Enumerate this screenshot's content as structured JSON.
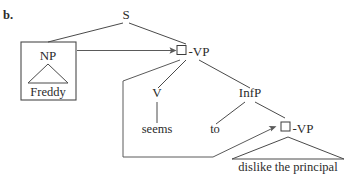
{
  "figure": {
    "item_label": "b.",
    "type": "syntax-tree",
    "background_color": "#ffffff",
    "line_color": "#4a4a4a",
    "text_color": "#2b2b2b"
  },
  "nodes": {
    "s": {
      "label": "S",
      "x": 126,
      "y": 19
    },
    "np": {
      "label": "NP",
      "x": 48,
      "y": 56
    },
    "np_terminal": {
      "label": "Freddy",
      "x": 48,
      "y": 96
    },
    "vp_top": {
      "label": "-VP",
      "x": 192,
      "y": 56
    },
    "v": {
      "label": "V",
      "x": 157,
      "y": 97
    },
    "v_terminal": {
      "label": "seems",
      "x": 157,
      "y": 133
    },
    "infp": {
      "label": "InfP",
      "x": 250,
      "y": 97
    },
    "inf_to": {
      "label": "to",
      "x": 215,
      "y": 133
    },
    "vp_low": {
      "label": "-VP",
      "x": 296,
      "y": 133
    },
    "vp_low_terminal": {
      "label": "dislike the principal",
      "x": 288,
      "y": 170
    }
  },
  "gap_squares": [
    {
      "name": "trace-square-upper",
      "x": 177,
      "y": 45,
      "size": 9
    },
    {
      "name": "trace-square-lower",
      "x": 281,
      "y": 122,
      "size": 9
    }
  ],
  "boxes": [
    {
      "name": "np-box",
      "x": 21,
      "y": 42,
      "width": 55,
      "height": 58
    }
  ],
  "triangles": [
    {
      "name": "np-triangle",
      "apex_x": 48,
      "apex_y": 62,
      "left_x": 28,
      "right_x": 68,
      "base_y": 83
    },
    {
      "name": "vp-low-triangle",
      "apex_x": 288,
      "apex_y": 139,
      "left_x": 232,
      "right_x": 344,
      "base_y": 159
    }
  ],
  "branches": [
    {
      "name": "s-to-np",
      "from": "S",
      "to": "NP"
    },
    {
      "name": "s-to-vp",
      "from": "S",
      "to": "VP"
    },
    {
      "name": "vp-to-v",
      "from": "VP",
      "to": "V"
    },
    {
      "name": "vp-to-infp",
      "from": "VP",
      "to": "InfP"
    },
    {
      "name": "v-to-seems",
      "from": "V",
      "to": "seems"
    },
    {
      "name": "infp-to-to",
      "from": "InfP",
      "to": "to"
    },
    {
      "name": "infp-to-vp",
      "from": "InfP",
      "to": "-VP"
    }
  ],
  "arrows": [
    {
      "name": "np-movement-arrow",
      "from": "NP box",
      "to": "upper trace square",
      "direction": "rightward"
    },
    {
      "name": "vp-movement-arrow",
      "from": "upper VP node",
      "to": "lower trace square",
      "direction": "around and upward"
    }
  ]
}
